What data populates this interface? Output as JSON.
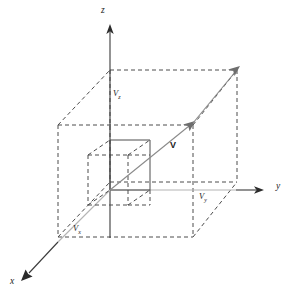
{
  "figure": {
    "type": "vector-decomposition-diagram",
    "background_color": "#ffffff",
    "line_color": "#4c4c4c",
    "vector_color": "#8a8a8a",
    "axis_color": "#3a3a3a"
  },
  "axes": {
    "z": {
      "label": "z",
      "direction": "up"
    },
    "y": {
      "label": "y",
      "direction": "right"
    },
    "x": {
      "label": "x",
      "direction": "down-left"
    }
  },
  "vector": {
    "label": "V",
    "description": "resultant vector from origin to far corner"
  },
  "components": {
    "z": {
      "label": "V",
      "subscript": "z"
    },
    "y": {
      "label": "V",
      "subscript": "y"
    },
    "x": {
      "label": "V",
      "subscript": "x"
    }
  },
  "boxes": {
    "outer": {
      "name": "outer-box",
      "style": "dashed"
    },
    "inner": {
      "name": "inner-box",
      "style": "mixed-solid-dashed"
    }
  }
}
